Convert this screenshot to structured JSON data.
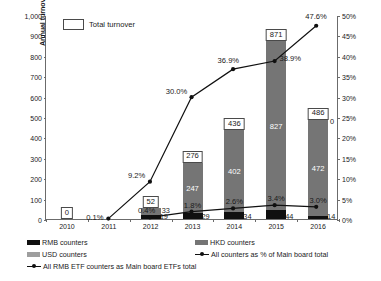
{
  "axes": {
    "y_left_title": "Annual turnover (HKD bil)",
    "y_left_ticks": [
      "1,000",
      "900",
      "800",
      "700",
      "600",
      "500",
      "400",
      "300",
      "200",
      "100",
      "0"
    ],
    "y_right_ticks": [
      "50%",
      "45%",
      "40%",
      "35%",
      "30%",
      "25%",
      "20%",
      "15%",
      "10%",
      "5%",
      "0%"
    ],
    "x_ticks": [
      "2010",
      "2011",
      "2012",
      "2013",
      "2014",
      "2015",
      "2016"
    ]
  },
  "top_legend": {
    "total_turnover_label": "Total turnover"
  },
  "legend": {
    "rmb_counters": "RMB counters",
    "hkd_counters": "HKD counters",
    "usd_counters": "USD counters",
    "all_counters_pct": "All counters as % of Main board total",
    "all_rmb_etf_pct": "All RMB ETF counters as Main board ETFs total"
  },
  "colors": {
    "rmb": "#101010",
    "hkd": "#757575",
    "usd": "#9e9e9e",
    "line": "#101010",
    "axis": "#6b6b6b"
  },
  "chart_data": {
    "type": "bar",
    "title": "",
    "xlabel": "",
    "ylabel": "Annual turnover (HKD bil)",
    "ylabel_right": "Percentage",
    "ylim": [
      0,
      1000
    ],
    "ylim_right": [
      0,
      50
    ],
    "grid": false,
    "legend_position": "bottom",
    "categories": [
      "2010",
      "2011",
      "2012",
      "2013",
      "2014",
      "2015",
      "2016"
    ],
    "series": [
      {
        "name": "RMB counters",
        "type": "bar-stacked",
        "values": [
          0,
          0,
          19,
          29,
          34,
          44,
          14
        ],
        "labels": [
          "",
          "",
          "19",
          "29",
          "34",
          "44",
          "14"
        ]
      },
      {
        "name": "HKD counters",
        "type": "bar-stacked",
        "values": [
          0,
          0,
          33,
          247,
          402,
          827,
          472
        ],
        "labels": [
          "",
          "",
          "33",
          "247",
          "402",
          "827",
          "472"
        ]
      },
      {
        "name": "USD counters",
        "type": "bar-stacked",
        "values": [
          0,
          0,
          0,
          0,
          0,
          0,
          0
        ],
        "labels": [
          "",
          "",
          "",
          "",
          "",
          "",
          "0"
        ]
      },
      {
        "name": "Total turnover",
        "type": "label",
        "values": [
          0,
          null,
          52,
          276,
          436,
          871,
          486
        ],
        "labels": [
          "0",
          "",
          "52",
          "276",
          "436",
          "871",
          "486"
        ]
      },
      {
        "name": "All counters as % of Main board total",
        "type": "line",
        "axis": "right",
        "values": [
          null,
          null,
          0.4,
          1.8,
          2.6,
          3.4,
          3.0
        ],
        "labels": [
          "",
          "",
          "0.4%",
          "1.8%",
          "2.6%",
          "3.4%",
          "3.0%"
        ]
      },
      {
        "name": "All RMB ETF counters as Main board ETFs total",
        "type": "line",
        "axis": "right",
        "values": [
          null,
          0.1,
          9.2,
          30.0,
          36.9,
          38.9,
          47.6
        ],
        "labels": [
          "",
          "0.1%",
          "9.2%",
          "30.0%",
          "36.9%",
          "38.9%",
          "47.6%"
        ]
      }
    ]
  }
}
